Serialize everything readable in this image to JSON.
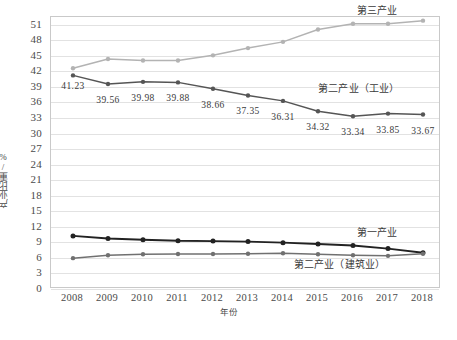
{
  "chart_data": {
    "type": "line",
    "title": "",
    "xlabel": "年份",
    "ylabel": "产业比重/%",
    "grid": true,
    "legend_position": "inline",
    "categories": [
      "2008",
      "2009",
      "2010",
      "2011",
      "2012",
      "2013",
      "2014",
      "2015",
      "2016",
      "2017",
      "2018"
    ],
    "x": [
      2008,
      2009,
      2010,
      2011,
      2012,
      2013,
      2014,
      2015,
      2016,
      2017,
      2018
    ],
    "ylim": [
      0,
      52.5
    ],
    "yticks": [
      0,
      3,
      6,
      9,
      12,
      15,
      18,
      21,
      24,
      27,
      30,
      33,
      36,
      39,
      42,
      45,
      48,
      51
    ],
    "series": [
      {
        "name": "第三产业",
        "color": "#b3b3b3",
        "values": [
          42.6,
          44.4,
          44.1,
          44.1,
          45.1,
          46.5,
          47.7,
          50.1,
          51.2,
          51.2,
          51.8
        ],
        "label_x": 2016.1,
        "label_y": 53.6
      },
      {
        "name": "第二产业（工业）",
        "color": "#555555",
        "values": [
          41.23,
          39.56,
          39.98,
          39.88,
          38.66,
          37.35,
          36.31,
          34.32,
          33.34,
          33.85,
          33.67
        ],
        "data_labels": [
          "41.23",
          "39.56",
          "39.98",
          "39.88",
          "38.66",
          "37.35",
          "36.31",
          "34.32",
          "33.34",
          "33.85",
          "33.67"
        ],
        "label_x": 2015.0,
        "label_y": 38.6
      },
      {
        "name": "第一产业",
        "color": "#222222",
        "values": [
          10.25,
          9.75,
          9.5,
          9.3,
          9.25,
          9.15,
          8.95,
          8.7,
          8.4,
          7.8,
          7.0
        ],
        "label_x": 2016.1,
        "label_y": 10.9
      },
      {
        "name": "第二产业（建筑业）",
        "color": "#707070",
        "values": [
          5.95,
          6.5,
          6.7,
          6.75,
          6.75,
          6.8,
          6.9,
          6.7,
          6.5,
          6.4,
          6.8
        ],
        "label_x": 2014.3,
        "label_y": 4.7
      }
    ]
  },
  "axes": {
    "y_axis_title": "产业比重/%",
    "x_axis_title": "年份"
  }
}
